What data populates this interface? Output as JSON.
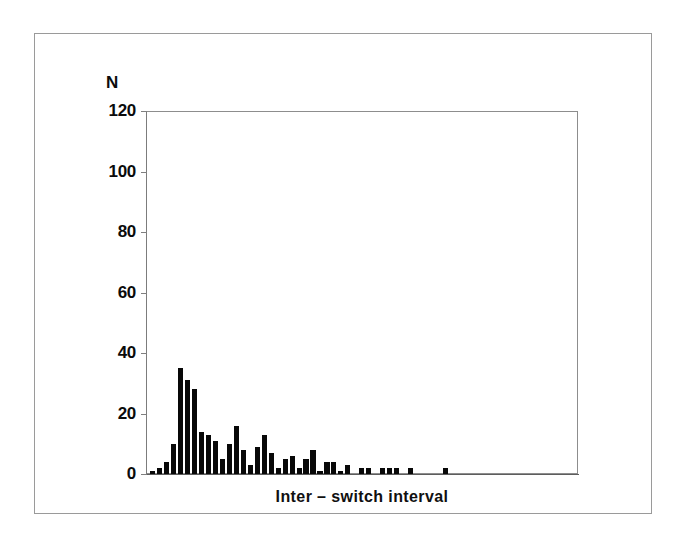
{
  "figure": {
    "name": "inter-switch-interval-histogram"
  },
  "axes": {
    "y_axis_label": "N",
    "y_ticks": [
      120,
      100,
      80,
      60,
      40,
      20,
      0
    ],
    "y_tick_labels": [
      "120",
      "100",
      "80",
      "60",
      "40",
      "20",
      "0"
    ],
    "x_axis_title": "Inter – switch interval"
  },
  "colors": {
    "bar_fill": "#080808",
    "axis": "#7f7f7f",
    "frame": "#9a9a9a",
    "text": "#0b0b0b",
    "background": "#ffffff"
  },
  "chart_data": {
    "type": "bar",
    "title": "",
    "subtitle": "",
    "xlabel": "Inter – switch interval",
    "ylabel": "N",
    "ylim": [
      0,
      120
    ],
    "yticks": [
      0,
      20,
      40,
      60,
      80,
      100,
      120
    ],
    "grid": false,
    "legend": false,
    "legend_position": "none",
    "xtick_labels": [],
    "note": "Histogram of inter-switch intervals; unimodal with sharp early peak and long right tail. Bin index is positional only (no x tick labels are printed on the axis).",
    "categories": [
      1,
      2,
      3,
      4,
      5,
      6,
      7,
      8,
      9,
      10,
      11,
      12,
      13,
      14,
      15,
      16,
      17,
      18,
      19,
      20,
      21,
      22,
      23,
      24,
      25,
      26,
      27,
      28,
      29,
      30,
      31,
      32,
      33,
      34,
      35,
      36,
      37,
      38,
      39,
      40,
      41,
      42,
      43,
      44,
      45,
      46,
      47,
      48,
      49,
      50,
      51,
      52,
      53,
      54,
      55,
      56,
      57,
      58,
      59,
      60
    ],
    "values": [
      1,
      2,
      4,
      10,
      35,
      31,
      28,
      14,
      13,
      11,
      5,
      10,
      16,
      8,
      3,
      9,
      13,
      7,
      2,
      5,
      6,
      2,
      5,
      8,
      1,
      4,
      4,
      1,
      3,
      0,
      2,
      2,
      0,
      2,
      2,
      2,
      0,
      2,
      0,
      0,
      0,
      0,
      2,
      0,
      0,
      0,
      0,
      0,
      0,
      0,
      0,
      0,
      0,
      0,
      0,
      0,
      0,
      0,
      0,
      0
    ]
  }
}
